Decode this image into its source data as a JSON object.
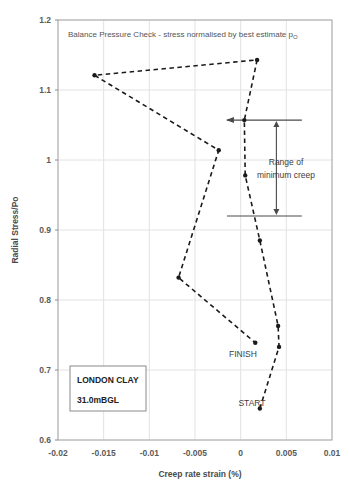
{
  "chart_data": {
    "type": "line",
    "title": "Balance Pressure Check - stress normalised by best estimate p",
    "title_subscript": "O",
    "xlabel": "Creep rate strain (%)",
    "ylabel": "Radial Stress/Po",
    "xlim": [
      -0.02,
      0.01
    ],
    "ylim": [
      0.6,
      1.2
    ],
    "xticks": [
      "-0.02",
      "-0.015",
      "-0.01",
      "-0.005",
      "0",
      "0.005",
      "0.01"
    ],
    "xtick_values": [
      -0.02,
      -0.015,
      -0.01,
      -0.005,
      0,
      0.005,
      0.01
    ],
    "yticks": [
      "0.6",
      "0.7",
      "0.8",
      "0.9",
      "1",
      "1.1",
      "1.2"
    ],
    "ytick_values": [
      0.6,
      0.7,
      0.8,
      0.9,
      1.0,
      1.1,
      1.2
    ],
    "grid": true,
    "legend": "none",
    "series": [
      {
        "name": "Creep rate path",
        "marker": "filled-circle",
        "line_style": "dashed",
        "color": "#1a1a1a",
        "points": [
          {
            "x": 0.0021,
            "y": 0.645,
            "label": "START"
          },
          {
            "x": 0.0042,
            "y": 0.733
          },
          {
            "x": 0.0041,
            "y": 0.763
          },
          {
            "x": 0.0021,
            "y": 0.885
          },
          {
            "x": 0.0005,
            "y": 0.978
          },
          {
            "x": 0.0004,
            "y": 1.057
          },
          {
            "x": 0.0018,
            "y": 1.143
          },
          {
            "x": -0.016,
            "y": 1.121
          },
          {
            "x": -0.0024,
            "y": 1.014
          },
          {
            "x": -0.0068,
            "y": 0.832
          },
          {
            "x": 0.0016,
            "y": 0.739,
            "label": "FINISH"
          }
        ]
      }
    ],
    "annotations": {
      "range_band": {
        "label_line1": "Range of",
        "label_line2": "minimum creep",
        "upper_y": 1.057,
        "lower_y": 0.92,
        "x_from": -0.0015,
        "x_to": 0.0067,
        "arrow": "double-headed-vertical"
      },
      "point_labels": {
        "start": "START",
        "finish": "FINISH"
      },
      "info_box": {
        "line1": "LONDON CLAY",
        "line2": "31.0mBGL"
      }
    },
    "colors": {
      "series": "#1a1a1a",
      "grid": "#e2e2e2",
      "axis": "#8c8c8c",
      "text": "#4a4a4a"
    }
  }
}
